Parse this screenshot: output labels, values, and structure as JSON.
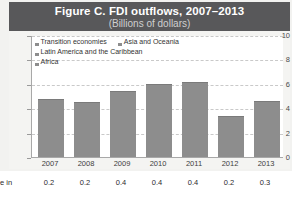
{
  "figure": {
    "title": "Figure C. FDI outflows, 2007–2013",
    "subtitle": "(Billions of dollars)",
    "title_band_color": "#58585a",
    "bar_color": "#8d8d8d"
  },
  "legend": {
    "items": [
      {
        "label": "Transition economies",
        "color": "#8d8d8d"
      },
      {
        "label": "Asia and Oceania",
        "color": "#8d8d8d"
      },
      {
        "label": "Latin America and the Caribbean",
        "color": "#8d8d8d"
      },
      {
        "label": "Africa",
        "color": "#8d8d8d"
      }
    ]
  },
  "footer": {
    "label": "e in",
    "values": [
      "0.2",
      "0.2",
      "0.4",
      "0.4",
      "0.4",
      "0.2",
      "0.3"
    ]
  },
  "chart_data": {
    "type": "bar",
    "title": "Figure C. FDI outflows, 2007–2013",
    "subtitle": "(Billions of dollars)",
    "xlabel": "",
    "ylabel": "",
    "ylim": [
      0,
      10
    ],
    "yticks": [
      0,
      2,
      4,
      6,
      8,
      10
    ],
    "grid": true,
    "legend_position": "top-left",
    "categories": [
      "2007",
      "2008",
      "2009",
      "2010",
      "2011",
      "2012",
      "2013"
    ],
    "series": [
      {
        "name": "Transition economies",
        "values": [
          4.5,
          4.2,
          4.6,
          4.9,
          5.6,
          3.1,
          4.0
        ]
      },
      {
        "name": "Asia and Oceania",
        "values": [
          0.0,
          0.0,
          0.3,
          0.6,
          0.1,
          0.0,
          0.2
        ]
      },
      {
        "name": "Latin America and the Caribbean",
        "values": [
          0.0,
          0.0,
          0.0,
          0.0,
          0.0,
          0.0,
          0.0
        ]
      },
      {
        "name": "Africa",
        "values": [
          0.2,
          0.2,
          0.4,
          0.4,
          0.4,
          0.2,
          0.3
        ]
      }
    ],
    "totals": [
      4.7,
      4.4,
      5.3,
      5.9,
      6.1,
      3.3,
      4.5
    ]
  }
}
